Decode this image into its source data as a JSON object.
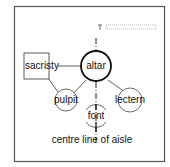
{
  "diagram": {
    "nodes": {
      "altar": "altar",
      "sacristy": "sacristy",
      "pulpit": "pulpit",
      "lectern": "lectern",
      "font": "font"
    },
    "caption": "centre line of aisle",
    "colors": {
      "stroke": "#222222",
      "frame": "#555555"
    }
  }
}
